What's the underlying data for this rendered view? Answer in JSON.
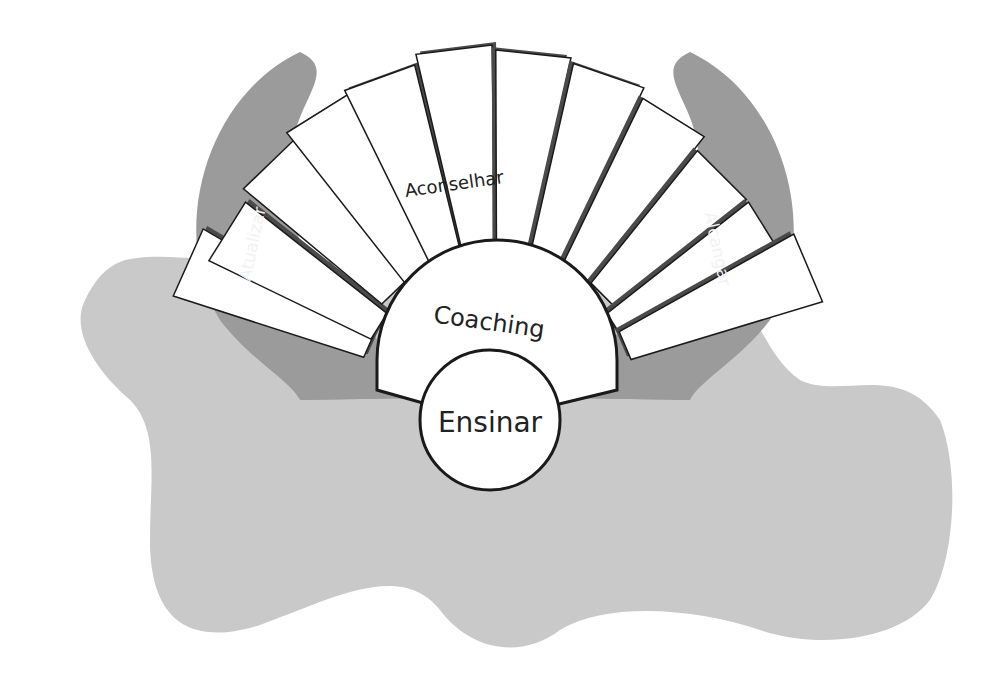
{
  "diagram": {
    "center_label": "Ensinar",
    "inner_arc_label": "Coaching",
    "top_label": "Aconselhar",
    "left_label": "Atualizar",
    "right_label": "Alcançar",
    "right_label_display": "Alcangar",
    "colors": {
      "background_blob": "#c8c8c8",
      "arrow": "#9a9a9a",
      "bar_shadow": "#4a4a4a",
      "panel_fill": "#ffffff",
      "outline": "#1a1a1a",
      "arrow_text": "#f2f2f2"
    }
  }
}
